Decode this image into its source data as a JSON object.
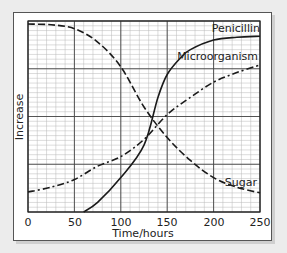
{
  "chart_data": {
    "type": "line",
    "title": "",
    "xlabel": "Time/hours",
    "ylabel": "Increase",
    "xlim": [
      0,
      250
    ],
    "ylim": [
      0,
      100
    ],
    "xticks": [
      0,
      50,
      100,
      150,
      200,
      250
    ],
    "xtick_labels": [
      "0",
      "50",
      "100",
      "150",
      "200",
      "250"
    ],
    "yticks_labels": [],
    "grid": true,
    "legend": "inline labels at right end of lines",
    "series": [
      {
        "name": "Penicillin",
        "style": "solid",
        "x": [
          60,
          75,
          100,
          125,
          140,
          150,
          165,
          175,
          200,
          225,
          250
        ],
        "values": [
          0,
          5,
          18,
          35,
          60,
          72,
          81,
          85,
          90,
          91.5,
          92
        ]
      },
      {
        "name": "Microorganism",
        "style": "dash-dot",
        "x": [
          0,
          25,
          50,
          75,
          100,
          125,
          150,
          175,
          200,
          225,
          250
        ],
        "values": [
          10.5,
          13,
          17,
          24,
          29,
          38,
          51,
          60,
          68,
          73,
          77
        ]
      },
      {
        "name": "Sugar",
        "style": "dashed",
        "x": [
          0,
          25,
          50,
          75,
          100,
          125,
          150,
          175,
          200,
          225,
          250
        ],
        "values": [
          98.4,
          98,
          96,
          89,
          76,
          55,
          39,
          27,
          18,
          13,
          10
        ]
      }
    ]
  },
  "labels": {
    "penicillin": "Penicillin",
    "microorganism": "Microorganism",
    "sugar": "Sugar",
    "xlabel": "Time/hours",
    "ylabel": "Increase",
    "ticks": [
      "0",
      "50",
      "100",
      "150",
      "200",
      "250"
    ]
  },
  "colors": {
    "line": "#1a1a1a",
    "grid_minor": "#b8b8b8",
    "grid_major": "#444444",
    "background": "#ececec",
    "card": "#ffffff"
  }
}
